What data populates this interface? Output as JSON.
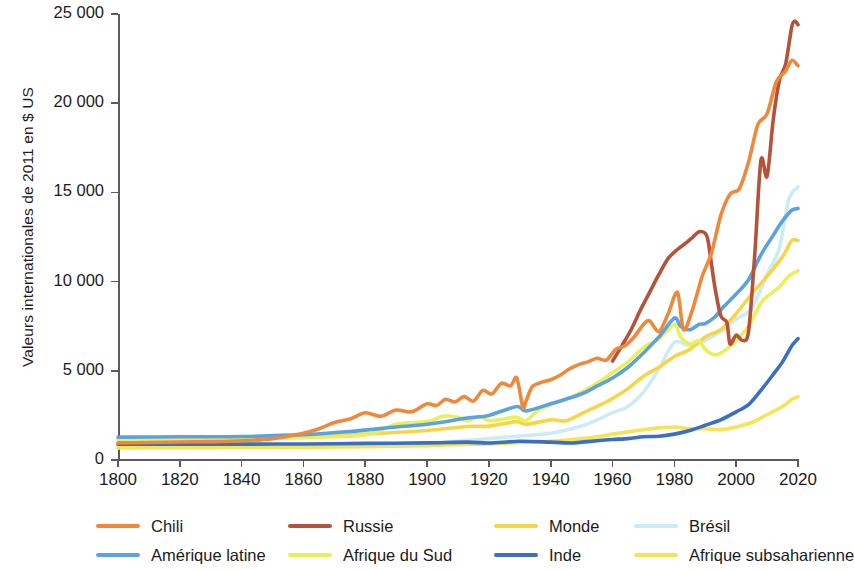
{
  "chart_data": {
    "type": "line",
    "title": "",
    "xlabel": "",
    "ylabel": "Valeurs internationales de 2011 en $ US",
    "xlim": [
      1800,
      2020
    ],
    "ylim": [
      0,
      25000
    ],
    "xticks": [
      1800,
      1820,
      1840,
      1860,
      1880,
      1900,
      1920,
      1940,
      1960,
      1980,
      2000,
      2020
    ],
    "xtick_labels": [
      "1800",
      "1820",
      "1840",
      "1860",
      "1880",
      "1900",
      "1920",
      "1940",
      "1960",
      "1980",
      "2000",
      "2020"
    ],
    "yticks": [
      0,
      5000,
      10000,
      15000,
      20000,
      25000
    ],
    "ytick_labels": [
      "0",
      "5 000",
      "10 000",
      "15 000",
      "20 000",
      "25 000"
    ],
    "grid": false,
    "legend_position": "bottom",
    "series": [
      {
        "name": "Chili",
        "color": "#F0883A",
        "x": [
          1800,
          1810,
          1820,
          1830,
          1840,
          1850,
          1860,
          1865,
          1870,
          1875,
          1880,
          1885,
          1890,
          1895,
          1900,
          1903,
          1906,
          1909,
          1912,
          1915,
          1918,
          1921,
          1924,
          1927,
          1929,
          1931,
          1932,
          1934,
          1937,
          1940,
          1943,
          1946,
          1949,
          1952,
          1955,
          1958,
          1961,
          1964,
          1967,
          1970,
          1972,
          1975,
          1978,
          1981,
          1983,
          1986,
          1989,
          1992,
          1995,
          1998,
          2001,
          2004,
          2007,
          2010,
          2013,
          2016,
          2018,
          2020
        ],
        "y": [
          960,
          980,
          1010,
          1030,
          1080,
          1200,
          1500,
          1750,
          2100,
          2300,
          2650,
          2450,
          2800,
          2700,
          3150,
          3050,
          3400,
          3250,
          3550,
          3300,
          3900,
          3700,
          4300,
          4150,
          4600,
          2950,
          3300,
          4100,
          4350,
          4500,
          4750,
          5100,
          5350,
          5500,
          5700,
          5600,
          6200,
          6400,
          6900,
          7600,
          7800,
          7200,
          8200,
          9400,
          7300,
          8500,
          10300,
          11600,
          13700,
          14900,
          15200,
          16700,
          18800,
          19400,
          21200,
          21800,
          22400,
          22100
        ]
      },
      {
        "name": "Russie",
        "color": "#B5533A",
        "x": [
          1960,
          1963,
          1966,
          1969,
          1972,
          1975,
          1978,
          1981,
          1984,
          1986,
          1988,
          1990,
          1991,
          1993,
          1995,
          1997,
          1998,
          2000,
          2002,
          2004,
          2006,
          2008,
          2010,
          2012,
          2014,
          2016,
          2018,
          2019,
          2020
        ],
        "y": [
          5550,
          6400,
          7300,
          8400,
          9400,
          10400,
          11300,
          11800,
          12200,
          12500,
          12800,
          12700,
          12200,
          9800,
          8100,
          7700,
          6500,
          7000,
          6700,
          7200,
          11500,
          16800,
          15900,
          19100,
          21300,
          22200,
          24300,
          24600,
          24400
        ]
      },
      {
        "name": "Monde",
        "color": "#F7D547",
        "x": [
          1800,
          1820,
          1840,
          1860,
          1880,
          1900,
          1913,
          1920,
          1929,
          1932,
          1940,
          1945,
          1950,
          1955,
          1960,
          1965,
          1970,
          1975,
          1980,
          1985,
          1990,
          1995,
          2000,
          2005,
          2010,
          2015,
          2018,
          2020
        ],
        "y": [
          1180,
          1190,
          1220,
          1300,
          1450,
          1650,
          1880,
          1900,
          2150,
          2000,
          2250,
          2200,
          2600,
          3000,
          3450,
          4000,
          4700,
          5200,
          5800,
          6200,
          6900,
          7300,
          8200,
          9300,
          10300,
          11400,
          12300,
          12300
        ]
      },
      {
        "name": "Brésil",
        "color": "#CCECF5",
        "x": [
          1800,
          1820,
          1840,
          1860,
          1880,
          1900,
          1913,
          1920,
          1930,
          1940,
          1950,
          1955,
          1960,
          1965,
          1970,
          1975,
          1980,
          1985,
          1990,
          1995,
          2000,
          2005,
          2010,
          2014,
          2017,
          2020
        ],
        "y": [
          780,
          790,
          800,
          830,
          880,
          950,
          1100,
          1200,
          1350,
          1500,
          1900,
          2250,
          2650,
          3000,
          3800,
          5100,
          6600,
          6400,
          6700,
          7200,
          7900,
          8500,
          10400,
          11900,
          14600,
          15300
        ]
      },
      {
        "name": "Amérique latine",
        "color": "#5BA3E0",
        "x": [
          1800,
          1820,
          1840,
          1860,
          1875,
          1890,
          1900,
          1913,
          1920,
          1929,
          1932,
          1940,
          1950,
          1955,
          1960,
          1965,
          1970,
          1975,
          1980,
          1982,
          1985,
          1988,
          1990,
          1993,
          1996,
          2000,
          2004,
          2008,
          2012,
          2015,
          2018,
          2020
        ],
        "y": [
          1280,
          1300,
          1320,
          1420,
          1600,
          1850,
          2000,
          2350,
          2500,
          3000,
          2750,
          3150,
          3700,
          4150,
          4600,
          5200,
          6000,
          6900,
          7950,
          7500,
          7300,
          7600,
          7650,
          8000,
          8600,
          9300,
          10100,
          11500,
          12600,
          13400,
          14000,
          14100
        ]
      },
      {
        "name": "Afrique du Sud",
        "color": "#E8F05A",
        "x": [
          1800,
          1820,
          1840,
          1860,
          1880,
          1890,
          1900,
          1905,
          1910,
          1913,
          1917,
          1920,
          1925,
          1929,
          1932,
          1936,
          1940,
          1945,
          1950,
          1955,
          1960,
          1965,
          1970,
          1975,
          1980,
          1982,
          1985,
          1988,
          1990,
          1993,
          1996,
          2000,
          2004,
          2008,
          2011,
          2014,
          2017,
          2020
        ],
        "y": [
          1150,
          1160,
          1180,
          1250,
          1400,
          2000,
          2150,
          2450,
          2400,
          2200,
          2450,
          2200,
          2300,
          2400,
          2200,
          2800,
          3100,
          3400,
          3800,
          4300,
          4900,
          5500,
          6300,
          6800,
          7600,
          6900,
          6500,
          6700,
          6200,
          5900,
          6100,
          6700,
          7500,
          8800,
          9300,
          9700,
          10300,
          10600
        ]
      },
      {
        "name": "Inde",
        "color": "#3A6FC4",
        "x": [
          1800,
          1820,
          1840,
          1860,
          1880,
          1900,
          1913,
          1920,
          1930,
          1940,
          1947,
          1950,
          1955,
          1960,
          1965,
          1970,
          1975,
          1980,
          1985,
          1990,
          1995,
          2000,
          2004,
          2008,
          2012,
          2015,
          2018,
          2020
        ],
        "y": [
          880,
          880,
          890,
          900,
          930,
          960,
          1000,
          950,
          1050,
          1000,
          950,
          1000,
          1080,
          1150,
          1200,
          1300,
          1330,
          1450,
          1650,
          1950,
          2250,
          2700,
          3100,
          3900,
          4800,
          5500,
          6400,
          6800
        ]
      },
      {
        "name": "Afrique subsaharienne",
        "color": "#F5E455",
        "x": [
          1800,
          1820,
          1840,
          1860,
          1880,
          1900,
          1913,
          1920,
          1930,
          1940,
          1950,
          1955,
          1960,
          1965,
          1970,
          1975,
          1980,
          1985,
          1990,
          1995,
          2000,
          2005,
          2010,
          2015,
          2018,
          2020
        ],
        "y": [
          680,
          690,
          700,
          720,
          750,
          800,
          880,
          900,
          980,
          1050,
          1200,
          1300,
          1450,
          1580,
          1700,
          1800,
          1850,
          1750,
          1750,
          1700,
          1850,
          2100,
          2550,
          3000,
          3400,
          3550
        ]
      }
    ]
  },
  "legend": {
    "rows": [
      [
        {
          "label": "Chili",
          "color": "#F0883A",
          "x": 0
        },
        {
          "label": "Russie",
          "color": "#B5533A",
          "x": 192
        },
        {
          "label": "Monde",
          "color": "#F7D547",
          "x": 398
        },
        {
          "label": "Brésil",
          "color": "#CCECF5",
          "x": 538
        }
      ],
      [
        {
          "label": "Amérique latine",
          "color": "#5BA3E0",
          "x": 0
        },
        {
          "label": "Afrique du Sud",
          "color": "#E8F05A",
          "x": 192
        },
        {
          "label": "Inde",
          "color": "#3A6FC4",
          "x": 398
        },
        {
          "label": "Afrique subsaharienne",
          "color": "#F5E455",
          "x": 538
        }
      ]
    ]
  }
}
